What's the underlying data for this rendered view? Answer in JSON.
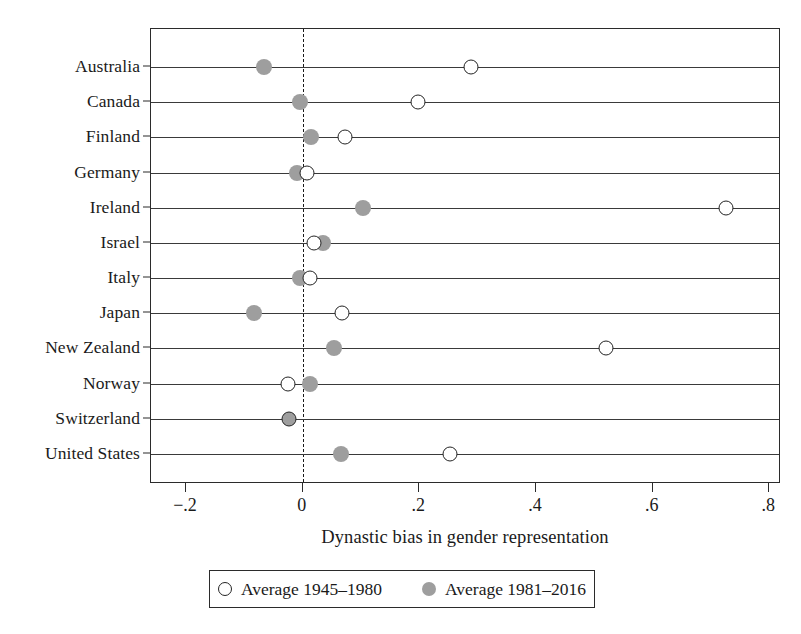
{
  "chart_data": {
    "type": "scatter",
    "title": "",
    "xlabel": "Dynastic bias in gender representation",
    "ylabel": "",
    "xlim": [
      -0.26,
      0.82
    ],
    "xticks": [
      -0.2,
      0,
      0.2,
      0.4,
      0.6,
      0.8
    ],
    "xticklabels": [
      "−.2",
      "0",
      ".2",
      ".4",
      ".6",
      ".8"
    ],
    "grid": "horizontal-row-lines",
    "reference_line": 0,
    "legend_position": "below-axis",
    "categories": [
      "Australia",
      "Canada",
      "Finland",
      "Germany",
      "Ireland",
      "Israel",
      "Italy",
      "Japan",
      "New Zealand",
      "Norway",
      "Switzerland",
      "United States"
    ],
    "series": [
      {
        "name": "Average 1945–1980",
        "marker": "open-circle",
        "color": "#ffffff",
        "edge_color": "#242424",
        "values": [
          0.288,
          0.198,
          0.073,
          0.008,
          0.725,
          0.02,
          0.013,
          0.067,
          0.52,
          -0.026,
          -0.024,
          0.253
        ]
      },
      {
        "name": "Average 1981–2016",
        "marker": "filled-circle",
        "color": "#9e9e9e",
        "edge_color": "#9e9e9e",
        "values": [
          -0.067,
          -0.005,
          0.015,
          -0.01,
          0.104,
          0.034,
          -0.005,
          -0.084,
          0.053,
          0.012,
          -0.024,
          0.065
        ]
      }
    ]
  },
  "axis": {
    "x_title": "Dynastic bias in gender representation"
  },
  "legend": {
    "items": [
      {
        "label": "Average 1945–1980",
        "marker": "open-circle"
      },
      {
        "label": "Average 1981–2016",
        "marker": "filled-circle"
      }
    ]
  },
  "colors": {
    "filled_marker": "#9e9e9e",
    "open_marker_edge": "#242424",
    "frame": "#2b2b2b",
    "background": "#ffffff"
  }
}
